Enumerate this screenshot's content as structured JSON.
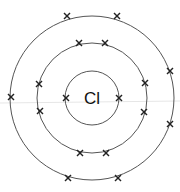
{
  "diagram": {
    "type": "bohr-model",
    "element_symbol": "Cl",
    "center": [
      92,
      98
    ],
    "colors": {
      "shell": "#555555",
      "electron": "#222222",
      "text": "#111111"
    },
    "shells": [
      {
        "name": "shell-1",
        "radius": 27,
        "electron_count": 2,
        "electrons": [
          [
            66,
            98
          ],
          [
            119,
            98
          ]
        ]
      },
      {
        "name": "shell-2",
        "radius": 55,
        "electron_count": 8,
        "electrons": [
          [
            79,
            43
          ],
          [
            105,
            43
          ],
          [
            145,
            83
          ],
          [
            144,
            112
          ],
          [
            106,
            153
          ],
          [
            80,
            153
          ],
          [
            40,
            111
          ],
          [
            39,
            84
          ]
        ]
      },
      {
        "name": "shell-3",
        "radius": 82,
        "electron_count": 7,
        "electrons": [
          [
            67,
            16
          ],
          [
            117,
            16
          ],
          [
            170,
            71
          ],
          [
            170,
            124
          ],
          [
            118,
            178
          ],
          [
            68,
            178
          ],
          [
            11,
            97
          ]
        ]
      }
    ],
    "total_electrons": 17
  }
}
